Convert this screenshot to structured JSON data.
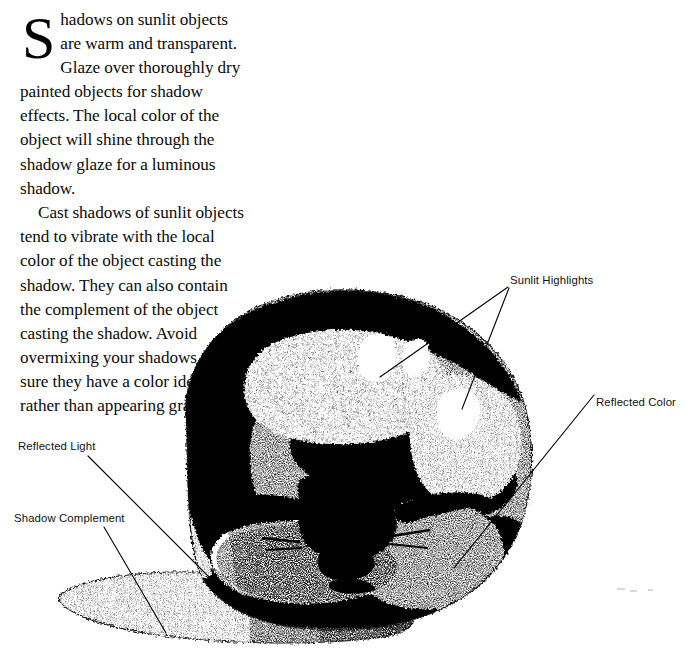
{
  "page": {
    "width": 694,
    "height": 666,
    "background": "#ffffff",
    "ink": "#000000"
  },
  "article": {
    "dropcap": "S",
    "paragraph_1": "hadows on sunlit objects are warm and transparent. Glaze over thoroughly dry painted objects for shadow effects. The local color of the object will shine through the shadow glaze for a luminous shadow.",
    "paragraph_2": "Cast shadows of sunlit objects tend to vibrate with the local color of the object casting the shadow. They can also contain the complement of the object casting the shadow. Avoid overmixing your shadows to be sure they have a color identity, rather than appearing gray."
  },
  "figure": {
    "annotations": [
      {
        "id": "sunlit-highlights",
        "label": "Sunlit Highlights",
        "leaders": [
          {
            "x1": 508,
            "y1": 287,
            "x2": 380,
            "y2": 377
          },
          {
            "x1": 509,
            "y1": 288,
            "x2": 462,
            "y2": 409
          }
        ]
      },
      {
        "id": "reflected-color",
        "label": "Reflected Color",
        "leaders": [
          {
            "x1": 594,
            "y1": 395,
            "x2": 454,
            "y2": 568
          }
        ]
      },
      {
        "id": "reflected-light",
        "label": "Reflected Light",
        "leaders": [
          {
            "x1": 88,
            "y1": 456,
            "x2": 221,
            "y2": 589
          }
        ]
      },
      {
        "id": "shadow-complement",
        "label": "Shadow Complement",
        "leaders": [
          {
            "x1": 104,
            "y1": 527,
            "x2": 166,
            "y2": 633
          }
        ]
      }
    ]
  }
}
